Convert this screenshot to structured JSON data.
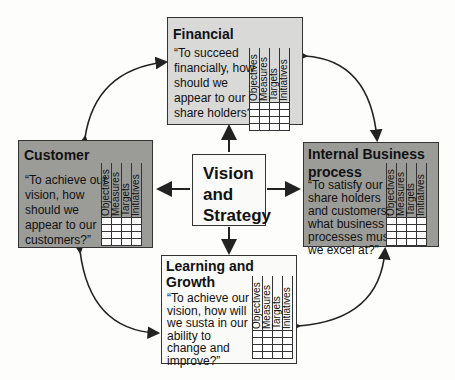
{
  "diagram": {
    "center": {
      "label_lines": [
        "Vision",
        "and",
        "Strategy"
      ]
    },
    "perspectives": {
      "financial": {
        "title": "Financial",
        "question_lines": [
          "“To succeed",
          "financially, how",
          "should we",
          "appear to our",
          "share holders?”"
        ]
      },
      "customer": {
        "title": "Customer",
        "question_lines": [
          "“To achieve our",
          "vision, how",
          "should we",
          "appear to our",
          "customers?”"
        ]
      },
      "internal": {
        "title_lines": [
          "Internal Business",
          "process"
        ],
        "question_lines": [
          "“To satisfy our",
          "share holders",
          "and customers,",
          "what business",
          "processes must",
          "we excel at?”"
        ]
      },
      "learning": {
        "title_lines": [
          "Learning and",
          "Growth"
        ],
        "question_lines": [
          "“To achieve our",
          "vision, how will",
          "we susta in our",
          "ability to",
          "change and",
          "improve?”"
        ]
      }
    },
    "table_columns": [
      "Objectives",
      "Measures",
      "Targets",
      "Initiatives"
    ],
    "colors": {
      "light_box": "#d9d9d7",
      "dark_box": "#9b9b98",
      "white_box": "#fafaf8",
      "line": "#333333"
    }
  }
}
